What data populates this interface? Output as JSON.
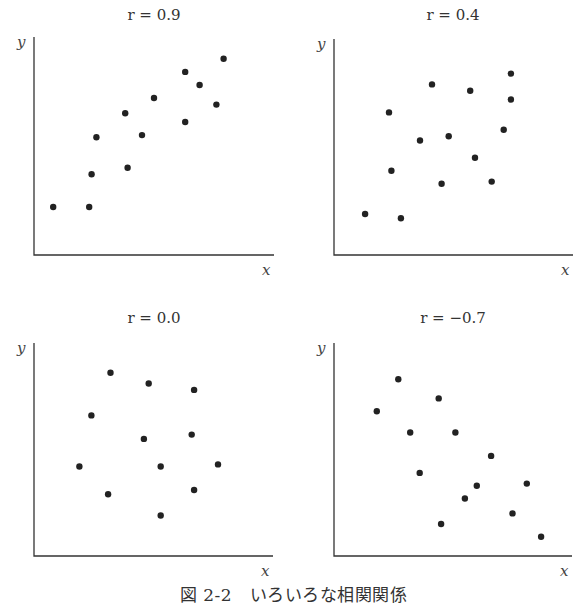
{
  "caption": "図 2-2　いろいろな相関関係",
  "chart_data": [
    {
      "type": "scatter",
      "title": "r = 0.9",
      "r": 0.9,
      "xlabel": "x",
      "ylabel": "y",
      "grid": false,
      "ticks": false,
      "points": [
        [
          8,
          22
        ],
        [
          23,
          22
        ],
        [
          24,
          37
        ],
        [
          26,
          54
        ],
        [
          38,
          65
        ],
        [
          39,
          40
        ],
        [
          45,
          55
        ],
        [
          50,
          72
        ],
        [
          63,
          84
        ],
        [
          63,
          61
        ],
        [
          69,
          78
        ],
        [
          76,
          69
        ],
        [
          79,
          90
        ]
      ]
    },
    {
      "type": "scatter",
      "title": "r = 0.4",
      "r": 0.4,
      "xlabel": "x",
      "ylabel": "y",
      "grid": false,
      "ticks": false,
      "points": [
        [
          13,
          19
        ],
        [
          28,
          17
        ],
        [
          23,
          66
        ],
        [
          24,
          39
        ],
        [
          41,
          79
        ],
        [
          36,
          53
        ],
        [
          48,
          55
        ],
        [
          45,
          33
        ],
        [
          57,
          76
        ],
        [
          59,
          45
        ],
        [
          66,
          34
        ],
        [
          71,
          58
        ],
        [
          74,
          84
        ],
        [
          74,
          72
        ]
      ]
    },
    {
      "type": "scatter",
      "title": "r = 0.0",
      "r": 0.0,
      "xlabel": "x",
      "ylabel": "y",
      "grid": false,
      "ticks": false,
      "points": [
        [
          32,
          86
        ],
        [
          48,
          81
        ],
        [
          67,
          78
        ],
        [
          24,
          66
        ],
        [
          46,
          55
        ],
        [
          66,
          57
        ],
        [
          19,
          42
        ],
        [
          53,
          42
        ],
        [
          77,
          43
        ],
        [
          31,
          29
        ],
        [
          67,
          31
        ],
        [
          53,
          19
        ]
      ]
    },
    {
      "type": "scatter",
      "title": "r = −0.7",
      "r": -0.7,
      "xlabel": "x",
      "ylabel": "y",
      "grid": false,
      "ticks": false,
      "points": [
        [
          27,
          83
        ],
        [
          18,
          68
        ],
        [
          44,
          74
        ],
        [
          32,
          58
        ],
        [
          51,
          58
        ],
        [
          66,
          47
        ],
        [
          36,
          39
        ],
        [
          60,
          33
        ],
        [
          81,
          34
        ],
        [
          55,
          27
        ],
        [
          75,
          20
        ],
        [
          45,
          15
        ],
        [
          87,
          9
        ]
      ]
    }
  ]
}
